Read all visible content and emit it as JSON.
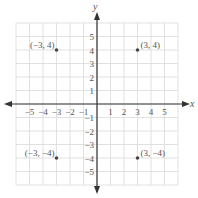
{
  "chart_data": {
    "type": "scatter",
    "title": "",
    "xlabel": "x",
    "ylabel": "y",
    "xlim": [
      -6,
      6
    ],
    "ylim": [
      -6,
      6
    ],
    "grid": true,
    "x_ticks": [
      "−5",
      "−4",
      "−3",
      "−2",
      "−1",
      "1",
      "2",
      "3",
      "4",
      "5"
    ],
    "y_ticks": [
      "5",
      "4",
      "3",
      "2",
      "1",
      "−1",
      "−2",
      "−3",
      "−4",
      "−5"
    ],
    "points": [
      {
        "x": -3,
        "y": 4,
        "label": "(−3, 4)"
      },
      {
        "x": 3,
        "y": 4,
        "label": "(3, 4)"
      },
      {
        "x": -3,
        "y": -4,
        "label": "(−3, −4)"
      },
      {
        "x": 3,
        "y": -4,
        "label": "(3, −4)"
      }
    ]
  },
  "axes": {
    "x_label": "x",
    "y_label": "y"
  },
  "colors": {
    "grid": "#d9d9d9",
    "axis": "#333333",
    "point": "#444444",
    "text": "#555555"
  }
}
